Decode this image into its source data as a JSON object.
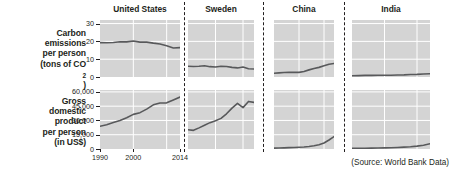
{
  "figure": {
    "source_note": "(Source: World Bank Data)",
    "row_labels": [
      {
        "id": "carbon",
        "lines": [
          "Carbon",
          "emissions",
          "per person",
          "(tons of CO2)"
        ],
        "line1": "Carbon",
        "line2": "emissions",
        "line3": "per person",
        "line4_pre": "(tons of CO",
        "line4_sub": "2",
        "line4_post": ")"
      },
      {
        "id": "gdp",
        "lines": [
          "Gross",
          "domestic",
          "product",
          "per person",
          "(in US$)"
        ],
        "line1": "Gross",
        "line2": "domestic",
        "line3": "product",
        "line4": "per person",
        "line5": "(in US$)"
      }
    ],
    "column_titles": [
      "United States",
      "Sweden",
      "China",
      "India"
    ],
    "x_tick_labels": [
      "1990",
      "2000",
      "2014"
    ],
    "carbon_y_ticks": [
      "30",
      "20",
      "10",
      "0"
    ],
    "gdp_y_ticks": [
      "60,000",
      "45,000",
      "30,000",
      "15,000",
      "0"
    ],
    "colors": {
      "panel_background": "#d4d4d4",
      "gridline": "#ffffff",
      "series_line": "#58595b",
      "text": "#231f20",
      "page_background": "#ffffff"
    }
  },
  "chart_data": [
    {
      "type": "line",
      "id": "carbon-united-states",
      "title": "United States",
      "ylabel": "Carbon emissions per person (tons of CO2)",
      "xlabel": "",
      "xlim": [
        1990,
        2014
      ],
      "ylim": [
        0,
        32
      ],
      "yticks": [
        0,
        10,
        20,
        30
      ],
      "xticks": [
        1990,
        2000,
        2014
      ],
      "grid": true,
      "x": [
        1990,
        1992,
        1994,
        1996,
        1998,
        2000,
        2002,
        2004,
        2006,
        2008,
        2010,
        2012,
        2014
      ],
      "values": [
        19.3,
        19.2,
        19.4,
        19.8,
        19.7,
        20.2,
        19.6,
        19.6,
        19.0,
        18.5,
        17.5,
        16.3,
        16.5
      ]
    },
    {
      "type": "line",
      "id": "carbon-sweden",
      "title": "Sweden",
      "xlim": [
        1990,
        2014
      ],
      "ylim": [
        0,
        32
      ],
      "yticks": [
        0,
        10,
        20,
        30
      ],
      "grid": true,
      "x": [
        1990,
        1992,
        1994,
        1996,
        1998,
        2000,
        2002,
        2004,
        2006,
        2008,
        2010,
        2012,
        2014
      ],
      "values": [
        6.0,
        5.9,
        6.0,
        6.3,
        5.8,
        5.6,
        6.0,
        5.9,
        5.4,
        5.1,
        5.6,
        4.6,
        4.5
      ]
    },
    {
      "type": "line",
      "id": "carbon-china",
      "title": "China",
      "xlim": [
        1990,
        2014
      ],
      "ylim": [
        0,
        32
      ],
      "yticks": [
        0,
        10,
        20,
        30
      ],
      "grid": true,
      "x": [
        1990,
        1992,
        1994,
        1996,
        1998,
        2000,
        2002,
        2004,
        2006,
        2008,
        2010,
        2012,
        2014
      ],
      "values": [
        2.1,
        2.3,
        2.5,
        2.7,
        2.6,
        2.6,
        3.1,
        4.0,
        4.8,
        5.4,
        6.3,
        7.2,
        7.6
      ]
    },
    {
      "type": "line",
      "id": "carbon-india",
      "title": "India",
      "xlim": [
        1990,
        2014
      ],
      "ylim": [
        0,
        32
      ],
      "yticks": [
        0,
        10,
        20,
        30
      ],
      "grid": true,
      "x": [
        1990,
        1992,
        1994,
        1996,
        1998,
        2000,
        2002,
        2004,
        2006,
        2008,
        2010,
        2012,
        2014
      ],
      "values": [
        0.7,
        0.8,
        0.9,
        0.9,
        1.0,
        1.0,
        1.0,
        1.1,
        1.2,
        1.4,
        1.5,
        1.7,
        1.8
      ]
    },
    {
      "type": "line",
      "id": "gdp-united-states",
      "title": "United States",
      "ylabel": "Gross domestic product per person (in US$)",
      "xlim": [
        1990,
        2014
      ],
      "ylim": [
        0,
        62000
      ],
      "yticks": [
        0,
        15000,
        30000,
        45000,
        60000
      ],
      "xticks": [
        1990,
        2000,
        2014
      ],
      "grid": true,
      "x": [
        1990,
        1992,
        1994,
        1996,
        1998,
        2000,
        2002,
        2004,
        2006,
        2008,
        2010,
        2012,
        2014
      ],
      "values": [
        23900,
        25500,
        27800,
        30000,
        32900,
        36400,
        38200,
        41900,
        46400,
        48400,
        48500,
        51500,
        54600
      ]
    },
    {
      "type": "line",
      "id": "gdp-sweden",
      "title": "Sweden",
      "xlim": [
        1990,
        2014
      ],
      "ylim": [
        0,
        62000
      ],
      "yticks": [
        0,
        15000,
        30000,
        45000,
        60000
      ],
      "grid": true,
      "x": [
        1990,
        1992,
        1994,
        1996,
        1998,
        2000,
        2002,
        2004,
        2006,
        2008,
        2010,
        2012,
        2014
      ],
      "values": [
        20200,
        19600,
        22200,
        25000,
        27700,
        29600,
        32200,
        37000,
        43000,
        48000,
        43500,
        50000,
        49000
      ]
    },
    {
      "type": "line",
      "id": "gdp-china",
      "title": "China",
      "xlim": [
        1990,
        2014
      ],
      "ylim": [
        0,
        62000
      ],
      "yticks": [
        0,
        15000,
        30000,
        45000,
        60000
      ],
      "grid": true,
      "x": [
        1990,
        1992,
        1994,
        1996,
        1998,
        2000,
        2002,
        2004,
        2006,
        2008,
        2010,
        2012,
        2014
      ],
      "values": [
        900,
        1000,
        1200,
        1400,
        1600,
        1800,
        2100,
        2600,
        3400,
        4500,
        6300,
        9500,
        13000
      ]
    },
    {
      "type": "line",
      "id": "gdp-india",
      "title": "India",
      "xlim": [
        1990,
        2014
      ],
      "ylim": [
        0,
        62000
      ],
      "yticks": [
        0,
        15000,
        30000,
        45000,
        60000
      ],
      "grid": true,
      "x": [
        1990,
        1992,
        1994,
        1996,
        1998,
        2000,
        2002,
        2004,
        2006,
        2008,
        2010,
        2012,
        2014
      ],
      "values": [
        700,
        750,
        850,
        950,
        1050,
        1200,
        1350,
        1600,
        2000,
        2400,
        3000,
        4000,
        5500
      ]
    }
  ]
}
